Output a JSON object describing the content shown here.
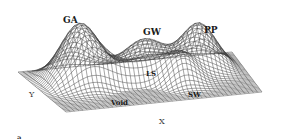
{
  "figure": {
    "type": "3d-wireframe-surface",
    "panel_label": "a",
    "axes": {
      "x_label": "X",
      "y_label": "Y"
    },
    "regions": [
      {
        "id": "ga",
        "label": "GA",
        "kind": "peak"
      },
      {
        "id": "gw",
        "label": "GW",
        "kind": "peak"
      },
      {
        "id": "pp",
        "label": "PP",
        "kind": "peak"
      },
      {
        "id": "ls",
        "label": "LS",
        "kind": "ridge"
      },
      {
        "id": "void",
        "label": "Void",
        "kind": "basin"
      },
      {
        "id": "sw",
        "label": "SW",
        "kind": "peak"
      }
    ],
    "colors": {
      "mesh": "#3a3a3a",
      "background": "#ffffff",
      "text": "#1a1a1a"
    }
  }
}
